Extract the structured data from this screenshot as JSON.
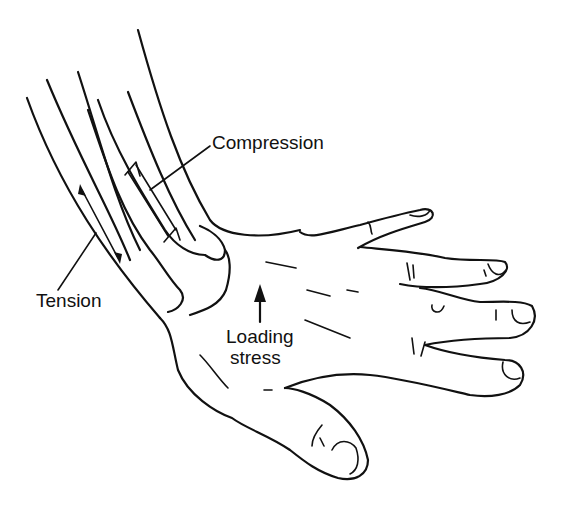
{
  "figure": {
    "ink_color": "#111111",
    "background_color": "#ffffff"
  },
  "labels": {
    "compression": "Compression",
    "tension": "Tension",
    "loading_line1": "Loading",
    "loading_line2": "stress"
  },
  "icons": {
    "loading_arrow": "arrow-up-icon",
    "tension_arrows": "double-headed-arrow-icon",
    "compression_arrows": "converging-arrows-icon"
  }
}
